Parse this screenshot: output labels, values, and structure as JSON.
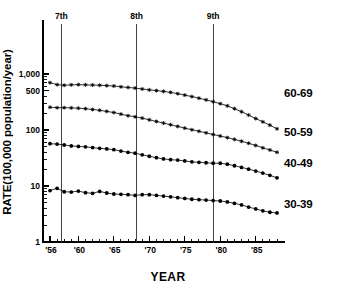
{
  "chart_data": {
    "type": "line",
    "title": "",
    "xlabel": "YEAR",
    "ylabel": "RATE(100,000 population/year)",
    "yscale": "log",
    "ylim": [
      1,
      2000
    ],
    "xlim": [
      1956,
      1988
    ],
    "grid": false,
    "legend_position": "right-inline",
    "ytick_values": [
      1,
      10,
      100,
      500,
      1000
    ],
    "ytick_labels": [
      "1",
      "10",
      "100",
      "500",
      "1,000"
    ],
    "xtick_values": [
      1956,
      1960,
      1965,
      1970,
      1975,
      1980,
      1985
    ],
    "xtick_labels": [
      "'56",
      "'60",
      "'65",
      "'70",
      "'75",
      "'80",
      "'85"
    ],
    "x": [
      1956,
      1957,
      1958,
      1959,
      1960,
      1961,
      1962,
      1963,
      1964,
      1965,
      1966,
      1967,
      1968,
      1969,
      1970,
      1971,
      1972,
      1973,
      1974,
      1975,
      1976,
      1977,
      1978,
      1979,
      1980,
      1981,
      1982,
      1983,
      1984,
      1985,
      1986,
      1987,
      1988
    ],
    "series": [
      {
        "name": "60-69",
        "label": "60-69",
        "marker": "star",
        "values": [
          700,
          645,
          630,
          640,
          645,
          640,
          635,
          630,
          620,
          610,
          590,
          575,
          560,
          540,
          520,
          505,
          490,
          470,
          445,
          420,
          395,
          370,
          345,
          320,
          295,
          270,
          240,
          212,
          185,
          160,
          140,
          122,
          105
        ]
      },
      {
        "name": "50-59",
        "label": "50-59",
        "marker": "star",
        "values": [
          255,
          250,
          250,
          248,
          245,
          240,
          232,
          225,
          215,
          205,
          192,
          180,
          172,
          163,
          152,
          142,
          133,
          124,
          116,
          108,
          101,
          95,
          89,
          83,
          78,
          73,
          68,
          63,
          58,
          53,
          48,
          44,
          40
        ]
      },
      {
        "name": "40-49",
        "label": "40-49",
        "marker": "dot",
        "values": [
          57,
          56,
          54,
          52,
          51,
          50,
          48.5,
          47,
          46,
          44.5,
          42,
          40,
          38.5,
          36,
          34,
          32,
          30.5,
          29.5,
          29,
          28,
          27,
          26.5,
          26,
          25.5,
          25.5,
          24.5,
          23,
          21.5,
          20,
          18.5,
          17,
          15.5,
          14
        ]
      },
      {
        "name": "30-39",
        "label": "30-39",
        "marker": "dot",
        "values": [
          8.3,
          9.1,
          7.9,
          7.8,
          8.1,
          7.6,
          7.4,
          8.0,
          7.5,
          7.2,
          7.1,
          7.0,
          6.8,
          7.0,
          7.0,
          6.8,
          6.6,
          6.4,
          6.2,
          6.0,
          5.8,
          5.7,
          5.6,
          5.5,
          5.4,
          5.2,
          4.9,
          4.6,
          4.2,
          3.9,
          3.6,
          3.4,
          3.3
        ]
      }
    ],
    "annotations": [
      {
        "label": "7th",
        "x": 1957.6
      },
      {
        "label": "8th",
        "x": 1968.2
      },
      {
        "label": "9th",
        "x": 1979.0
      }
    ]
  }
}
